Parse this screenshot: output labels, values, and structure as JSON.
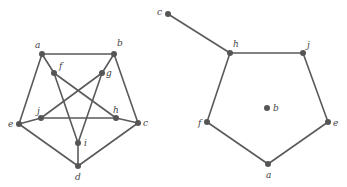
{
  "graphs": [
    {
      "id": "left",
      "nodes": [
        {
          "id": "a",
          "x": 42,
          "y": 54,
          "lx": 35,
          "ly": 48
        },
        {
          "id": "b",
          "x": 114,
          "y": 54,
          "lx": 117,
          "ly": 46
        },
        {
          "id": "f",
          "x": 54,
          "y": 73,
          "lx": 59,
          "ly": 69
        },
        {
          "id": "g",
          "x": 102,
          "y": 73,
          "lx": 106,
          "ly": 76
        },
        {
          "id": "j",
          "x": 41,
          "y": 118,
          "lx": 37,
          "ly": 114
        },
        {
          "id": "h",
          "x": 116,
          "y": 118,
          "lx": 113,
          "ly": 113
        },
        {
          "id": "e",
          "x": 19,
          "y": 124,
          "lx": 8,
          "ly": 127
        },
        {
          "id": "c",
          "x": 138,
          "y": 123,
          "lx": 143,
          "ly": 126
        },
        {
          "id": "i",
          "x": 78,
          "y": 143,
          "lx": 84,
          "ly": 146
        },
        {
          "id": "d",
          "x": 78,
          "y": 166,
          "lx": 75,
          "ly": 180
        }
      ],
      "edges": [
        [
          "a",
          "b"
        ],
        [
          "a",
          "e"
        ],
        [
          "b",
          "c"
        ],
        [
          "e",
          "d"
        ],
        [
          "c",
          "d"
        ],
        [
          "e",
          "j"
        ],
        [
          "j",
          "h"
        ],
        [
          "h",
          "c"
        ],
        [
          "a",
          "f"
        ],
        [
          "f",
          "h"
        ],
        [
          "f",
          "i"
        ],
        [
          "b",
          "g"
        ],
        [
          "g",
          "j"
        ],
        [
          "g",
          "i"
        ],
        [
          "i",
          "d"
        ]
      ]
    },
    {
      "id": "right",
      "nodes": [
        {
          "id": "c",
          "x": 168,
          "y": 14,
          "lx": 157,
          "ly": 15
        },
        {
          "id": "h",
          "x": 230,
          "y": 53,
          "lx": 233,
          "ly": 47
        },
        {
          "id": "j",
          "x": 303,
          "y": 53,
          "lx": 307,
          "ly": 48
        },
        {
          "id": "b",
          "x": 267,
          "y": 108,
          "lx": 273,
          "ly": 111
        },
        {
          "id": "f",
          "x": 207,
          "y": 122,
          "lx": 198,
          "ly": 126
        },
        {
          "id": "e",
          "x": 328,
          "y": 122,
          "lx": 333,
          "ly": 126
        },
        {
          "id": "a",
          "x": 268,
          "y": 164,
          "lx": 266,
          "ly": 178
        }
      ],
      "edges": [
        [
          "c",
          "h"
        ],
        [
          "h",
          "j"
        ],
        [
          "j",
          "e"
        ],
        [
          "e",
          "a"
        ],
        [
          "a",
          "f"
        ],
        [
          "f",
          "h"
        ]
      ]
    }
  ],
  "colors": {
    "edge": "#5a5a5a",
    "node": "#555555",
    "label": "#444444"
  }
}
